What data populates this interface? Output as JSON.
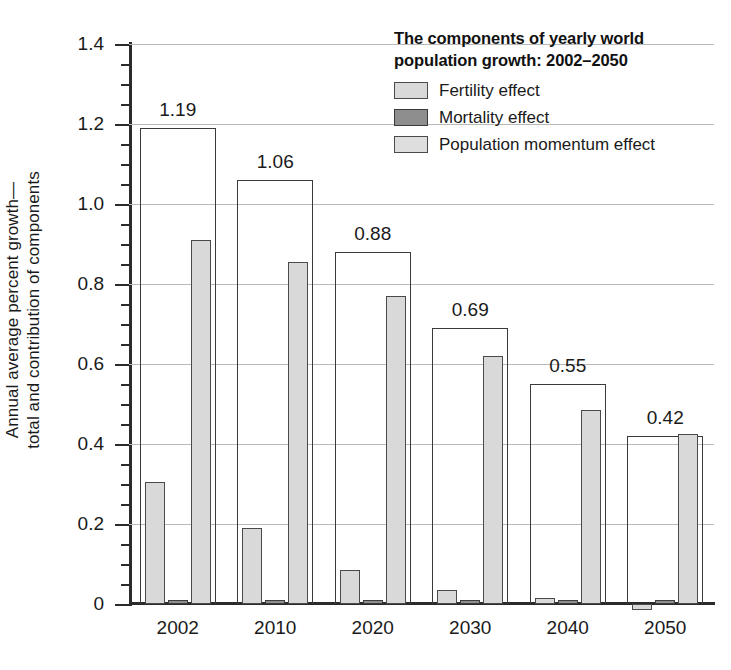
{
  "chart_data": {
    "type": "bar",
    "title": "The components of yearly world population growth: 2002–2050",
    "xlabel": "",
    "ylabel": "Annual average percent growth—total and contribution of components",
    "categories": [
      "2002",
      "2010",
      "2020",
      "2030",
      "2040",
      "2050"
    ],
    "ylim": [
      0,
      1.4
    ],
    "ytick_labels": [
      "0",
      "0.2",
      "0.4",
      "0.6",
      "0.8",
      "1.0",
      "1.2",
      "1.4"
    ],
    "ytick_values": [
      0,
      0.2,
      0.4,
      0.6,
      0.8,
      1.0,
      1.2,
      1.4
    ],
    "ytick_minor_step": 0.05,
    "grid": true,
    "grid_axis": "y",
    "legend_position": "top-right",
    "series": [
      {
        "name": "Total",
        "style": "outline",
        "values": [
          1.19,
          1.06,
          0.88,
          0.69,
          0.55,
          0.42
        ],
        "data_labels": [
          "1.19",
          "1.06",
          "0.88",
          "0.69",
          "0.55",
          "0.42"
        ]
      },
      {
        "name": "Fertility effect",
        "style": "light-gray",
        "values": [
          0.305,
          0.19,
          0.085,
          0.035,
          0.015,
          -0.015
        ]
      },
      {
        "name": "Mortality effect",
        "style": "dark-gray",
        "values": [
          0.01,
          0.01,
          0.01,
          0.01,
          0.01,
          0.01
        ]
      },
      {
        "name": "Population momentum effect",
        "style": "light-gray",
        "values": [
          0.91,
          0.855,
          0.77,
          0.62,
          0.485,
          0.425
        ]
      }
    ]
  },
  "legend": {
    "title_line_1": "The components of yearly world",
    "title_line_2": "population growth: 2002–2050",
    "items": [
      {
        "label": "Fertility effect",
        "swatch": "light-gray-swatch"
      },
      {
        "label": "Mortality effect",
        "swatch": "dark-gray-swatch"
      },
      {
        "label": "Population momentum effect",
        "swatch": "light-gray-swatch"
      }
    ]
  },
  "axes": {
    "y_title_line_1": "Annual average percent growth—",
    "y_title_line_2": "total and contribution of components"
  },
  "colors": {
    "light_gray": "#d9d9d9",
    "dark_gray": "#8e8e8e",
    "outline": "#3a3a3a",
    "gridline": "#b9b9b9",
    "axis": "#2b2b2b",
    "text": "#1a1a1a"
  }
}
